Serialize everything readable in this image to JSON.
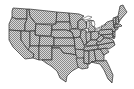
{
  "map": {
    "title": "Contiguous United States",
    "style": {
      "background": "#ffffff",
      "fill_dark": "#8a8a8a",
      "fill_light": "#d8d8d8",
      "border": "#2a2a2a",
      "fill_pattern": "checkerboard-dither"
    },
    "states": [
      {
        "id": "WA",
        "points": "13,8 27,9 27,19 16,19 12,17 12,11"
      },
      {
        "id": "OR",
        "points": "12,17 16,19 27,19 25,24 25,31 9,30 9,24"
      },
      {
        "id": "CA",
        "points": "9,30 21,31 21,40 34,54 33,58 25,59 19,53 13,47 9,40"
      },
      {
        "id": "NV",
        "points": "21,31 30,31 30,48 28,50 21,40"
      },
      {
        "id": "ID",
        "points": "27,9 29,9 30,16 33,20 36,24 35,31 25,31 25,24 27,19"
      },
      {
        "id": "MT",
        "points": "29,9 57,12 56,24 36,24 33,20 30,16"
      },
      {
        "id": "WY",
        "points": "36,24 52,25 51,36 35,35"
      },
      {
        "id": "UT",
        "points": "30,31 35,31 35,35 40,36 39,46 30,46"
      },
      {
        "id": "AZ",
        "points": "30,46 39,46 39,60 33,58 34,54 28,50"
      },
      {
        "id": "CO",
        "points": "40,36 54,37 54,46 39,46"
      },
      {
        "id": "NM",
        "points": "39,46 52,46 52,60 42,60 39,60"
      },
      {
        "id": "ND",
        "points": "57,12 69,13 70,22 56,22"
      },
      {
        "id": "SD",
        "points": "56,22 70,22 70,31 66,30 52,30 52,25 56,24"
      },
      {
        "id": "NE",
        "points": "52,30 66,30 72,32 74,38 54,38 54,37 51,36"
      },
      {
        "id": "KS",
        "points": "54,38 74,38 75,46 54,46"
      },
      {
        "id": "OK",
        "points": "52,46 75,46 76,55 71,54 63,53 60,48 52,48"
      },
      {
        "id": "TX",
        "points": "52,48 60,48 63,53 71,54 76,55 78,57 79,67 72,71 67,76 66,82 60,78 57,71 51,66 46,63 42,60 52,60"
      },
      {
        "id": "MN",
        "points": "69,13 79,14 84,16 78,21 78,28 72,29 70,22"
      },
      {
        "id": "IA",
        "points": "70,29 79,29 81,32 80,37 74,38 72,32 70,31"
      },
      {
        "id": "MO",
        "points": "74,38 80,37 82,40 84,44 85,50 78,50 75,49 75,46"
      },
      {
        "id": "AR",
        "points": "75,49 85,50 84,58 78,59 76,55"
      },
      {
        "id": "LA",
        "points": "76,58 84,58 84,63 88,64 88,68 82,69 78,67"
      },
      {
        "id": "WI",
        "points": "78,21 82,19 86,22 87,28 81,30 79,29 78,28"
      },
      {
        "id": "IL",
        "points": "81,30 86,30 87,38 86,45 84,45 82,40 80,37 81,32"
      },
      {
        "id": "MI",
        "points": "86,22 90,20 94,21 92,26 95,27 95,32 89,32 88,28"
      },
      {
        "id": "IN",
        "points": "86,32 91,32 91,40 87,43 86,38"
      },
      {
        "id": "OH",
        "points": "91,32 98,31 99,37 96,40 91,40"
      },
      {
        "id": "KY",
        "points": "86,44 91,40 96,40 99,42 96,45 86,46"
      },
      {
        "id": "TN",
        "points": "84,47 100,45 98,49 84,51"
      },
      {
        "id": "MS",
        "points": "84,51 89,51 89,64 84,63 84,58"
      },
      {
        "id": "AL",
        "points": "89,51 94,50 96,61 91,62 90,64 89,64"
      },
      {
        "id": "GA",
        "points": "94,50 100,49 104,55 104,61 96,61"
      },
      {
        "id": "FL",
        "points": "91,62 96,61 104,61 106,60 109,66 113,75 112,83 108,79 104,70 100,64 95,63"
      },
      {
        "id": "SC",
        "points": "100,49 106,48 109,52 104,55"
      },
      {
        "id": "NC",
        "points": "98,45 114,42 115,45 109,49 106,48 100,49 98,49"
      },
      {
        "id": "VA",
        "points": "96,43 104,38 108,38 113,40 114,42 98,45"
      },
      {
        "id": "WV",
        "points": "96,40 99,37 101,35 104,38 100,42 99,42"
      },
      {
        "id": "PA",
        "points": "99,30 112,29 113,34 101,35 99,34"
      },
      {
        "id": "NY",
        "points": "101,28 107,22 113,20 114,27 116,31 113,32 112,29 101,30"
      },
      {
        "id": "MD",
        "points": "101,35 113,34 113,38 108,38 104,37"
      },
      {
        "id": "NJ",
        "points": "113,31 115,32 115,37 113,36"
      },
      {
        "id": "DE",
        "points": "113,36 115,37 114,39 113,38"
      },
      {
        "id": "CT",
        "points": "114,27 118,27 118,29 116,30"
      },
      {
        "id": "MA",
        "points": "114,25 120,24 122,26 118,27 114,27"
      },
      {
        "id": "VT",
        "points": "113,18 116,17 116,24 114,25"
      },
      {
        "id": "NH",
        "points": "116,17 118,16 119,23 116,24"
      },
      {
        "id": "ME",
        "points": "118,16 120,6 123,5 125,9 127,12 121,19 119,22"
      }
    ],
    "lakes": [
      {
        "id": "lake-superior",
        "points": "82,19 88,16 92,17 89,19 85,20"
      },
      {
        "id": "lake-michigan",
        "points": "87,21 89,21 89,28 87,29"
      },
      {
        "id": "lake-huron",
        "points": "91,21 94,21 95,25 93,27 92,25"
      },
      {
        "id": "lake-erie",
        "points": "95,29 100,27 100,28 96,30"
      },
      {
        "id": "lake-ontario",
        "points": "101,26 106,24 106,25 101,27"
      }
    ]
  }
}
